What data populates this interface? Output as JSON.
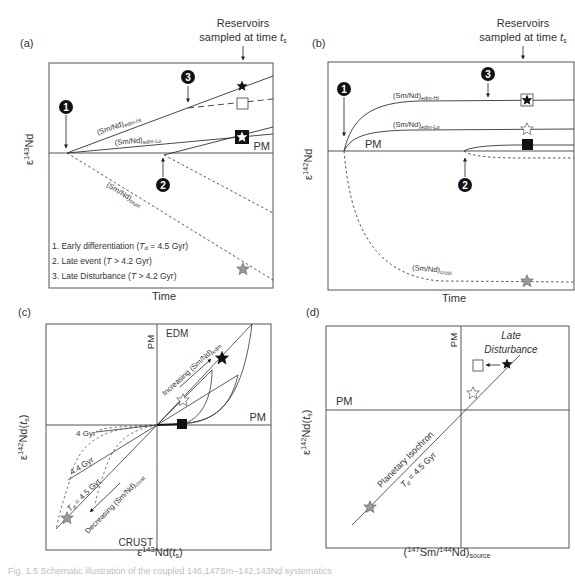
{
  "figure": {
    "caption_fragment": "Fig. 1.5 Schematic illustration of the coupled 146,147Sm–142,143Nd systematics",
    "panels": {
      "a": {
        "label": "(a)",
        "ylabel_eps": "ε",
        "ylabel_sup": "143",
        "ylabel_nd": "Nd",
        "xlabel": "Time",
        "sampled_line1": "Reservoirs",
        "sampled_line2": "sampled at time ",
        "sampled_t": "t",
        "sampled_sub": "s",
        "pm": "PM",
        "curve_hi": "(Sm/Nd)",
        "curve_hi_sub": "edm-Hi",
        "curve_lo": "(Sm/Nd)",
        "curve_lo_sub": "edm-Lo",
        "curve_crust": "(Sm/Nd)",
        "curve_crust_sub": "crust",
        "marker1": "1",
        "marker2": "2",
        "marker3": "3",
        "legend1_pre": "1. Early differentiation (",
        "legend1_T": "T",
        "legend1_sub": "d",
        "legend1_post": " = 4.5 Gyr)",
        "legend2_pre": "2. Late event (",
        "legend2_T": "T",
        "legend2_post": " > 4.2 Gyr)",
        "legend3_pre": "3. Late Disturbance (",
        "legend3_T": "T",
        "legend3_post": " > 4.2 Gyr)"
      },
      "b": {
        "label": "(b)",
        "ylabel_eps": "ε",
        "ylabel_sup": "142",
        "ylabel_nd": "Nd",
        "xlabel": "Time",
        "sampled_line1": "Reservoirs",
        "sampled_line2": "sampled at time ",
        "sampled_t": "t",
        "sampled_sub": "s",
        "pm": "PM",
        "curve_hi": "(Sm/Nd)",
        "curve_hi_sub": "edm-Hi",
        "curve_lo": "(Sm/Nd)",
        "curve_lo_sub": "edm-Lo",
        "curve_crust": "(Sm/Nd)",
        "curve_crust_sub": "crust",
        "marker1": "1",
        "marker2": "2",
        "marker3": "3"
      },
      "c": {
        "label": "(c)",
        "ylabel_eps": "ε",
        "ylabel_sup": "142",
        "ylabel_nd": "Nd(",
        "ylabel_t": "t",
        "ylabel_sub": "s",
        "ylabel_close": ")",
        "xlabel_eps": "ε",
        "xlabel_sup": "143",
        "xlabel_nd": "Nd(",
        "xlabel_t": "t",
        "xlabel_sub": "s",
        "xlabel_close": ")",
        "edm": "EDM",
        "crust": "CRUST",
        "pm_vertical": "PM",
        "pm_horizontal": "PM",
        "increasing": "Increasing (Sm/Nd)",
        "increasing_sub": "edm",
        "decreasing": "Decreasing (Sm/Nd)",
        "decreasing_sub": "crust",
        "iso_4": "4 Gyr",
        "iso_44": "4.4 Gyr",
        "iso_45_T": "T",
        "iso_45_sub": "d",
        "iso_45_post": " = 4.5 Gyr"
      },
      "d": {
        "label": "(d)",
        "ylabel_eps": "ε",
        "ylabel_sup": "142",
        "ylabel_nd": "Nd(",
        "ylabel_t": "t",
        "ylabel_sub": "s",
        "ylabel_close": ")",
        "xlabel_open": "(",
        "xlabel_sup1": "147",
        "xlabel_sm": "Sm/",
        "xlabel_sup2": "144",
        "xlabel_nd": "Nd)",
        "xlabel_sub": "source",
        "pm_vertical": "PM",
        "pm_horizontal": "PM",
        "late1": "Late",
        "late2": "Disturbance",
        "isochron": "Planetary Isochron",
        "iso_T": "T",
        "iso_sub": "d",
        "iso_post": " = 4.5 Gyr"
      }
    },
    "colors": {
      "line": "#3a3a3a",
      "frame": "#555555",
      "gray_star": "#9a9a9a",
      "black": "#111111"
    }
  }
}
